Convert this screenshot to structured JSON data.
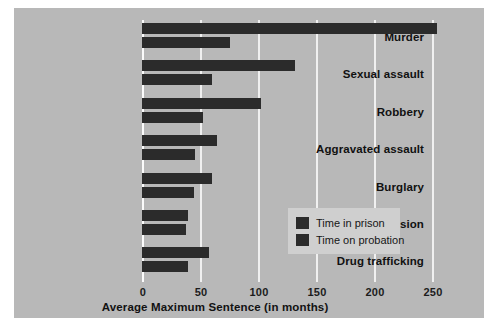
{
  "chart_data": {
    "type": "bar",
    "orientation": "horizontal",
    "title": "",
    "xlabel": "Average Maximum Sentence (in months)",
    "ylabel": "",
    "xlim": [
      0,
      270
    ],
    "xticks": [
      0,
      50,
      100,
      150,
      200,
      250
    ],
    "xtick_labels": [
      "0",
      "50",
      "100",
      "150",
      "200",
      "250"
    ],
    "grid": true,
    "legend_position": "middle-right-inside",
    "categories": [
      "Murder",
      "Sexual assault",
      "Robbery",
      "Aggravated assault",
      "Burglary",
      "Drug possession",
      "Drug trafficking"
    ],
    "series": [
      {
        "name": "Time in prison",
        "color": "#2b2b2b",
        "values": [
          254,
          132,
          103,
          65,
          60,
          40,
          58
        ]
      },
      {
        "name": "Time on probation",
        "color": "#2b2b2b",
        "values": [
          76,
          60,
          53,
          46,
          45,
          38,
          40
        ]
      }
    ]
  },
  "legend": {
    "items": [
      {
        "label": "Time in prison"
      },
      {
        "label": "Time on probation"
      }
    ]
  },
  "colors": {
    "panel_background": "#b8b8b8",
    "bar": "#2b2b2b",
    "gridline": "#f0f0f0",
    "legend_background": "#cfcfcf",
    "page_background": "#ffffff"
  }
}
